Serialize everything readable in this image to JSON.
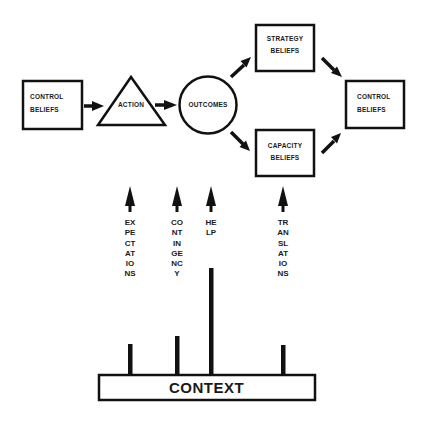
{
  "diagram": {
    "nodes": {
      "control_beliefs_left": {
        "shape": "rectangle",
        "line1": "CONTROL",
        "line2": "BELIEFS"
      },
      "action": {
        "shape": "triangle",
        "label": "ACTION"
      },
      "outcomes": {
        "shape": "circle",
        "label": "OUTCOMES"
      },
      "strategy_beliefs": {
        "shape": "rectangle",
        "line1": "STRATEGY",
        "line2": "BELIEFS"
      },
      "capacity_beliefs": {
        "shape": "rectangle",
        "line1": "CAPACITY",
        "line2": "BELIEFS"
      },
      "control_beliefs_right": {
        "shape": "rectangle",
        "line1": "CONTROL",
        "line2": "BELIEFS"
      },
      "context": {
        "shape": "rectangle",
        "label": "CONTEXT"
      }
    },
    "edges": [
      {
        "from": "control_beliefs_left",
        "to": "action"
      },
      {
        "from": "action",
        "to": "outcomes"
      },
      {
        "from": "outcomes",
        "to": "strategy_beliefs"
      },
      {
        "from": "outcomes",
        "to": "capacity_beliefs"
      },
      {
        "from": "strategy_beliefs",
        "to": "control_beliefs_right"
      },
      {
        "from": "capacity_beliefs",
        "to": "control_beliefs_right"
      }
    ],
    "context_arrows": [
      {
        "label": "EXPECTATIONS"
      },
      {
        "label": "CONTINGENCY"
      },
      {
        "label": "HELP"
      },
      {
        "label": "TRANSLATIONS"
      }
    ],
    "colors": {
      "stroke": "#111111",
      "background": "#ffffff"
    }
  }
}
